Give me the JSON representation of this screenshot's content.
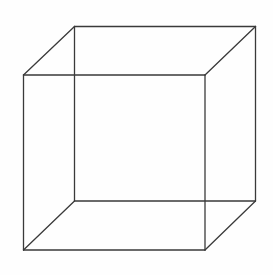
{
  "diagram": {
    "type": "wireframe-cube",
    "background": "#fefefe",
    "stroke_color": "#3a3a3a",
    "stroke_width": 1.3,
    "vertices": {
      "front_top_left": [
        23.5,
        75
      ],
      "front_top_right": [
        205,
        75
      ],
      "front_bottom_right": [
        205,
        250
      ],
      "front_bottom_left": [
        23.5,
        250
      ],
      "back_top_left": [
        74.5,
        26.5
      ],
      "back_top_right": [
        255.5,
        26.5
      ],
      "back_bottom_right": [
        255.5,
        201
      ],
      "back_bottom_left": [
        74.5,
        201
      ]
    },
    "edges": [
      {
        "name": "front-top-edge",
        "from": "front_top_left",
        "to": "front_top_right"
      },
      {
        "name": "front-right-edge",
        "from": "front_top_right",
        "to": "front_bottom_right"
      },
      {
        "name": "front-bottom-edge",
        "from": "front_bottom_right",
        "to": "front_bottom_left"
      },
      {
        "name": "front-left-edge",
        "from": "front_bottom_left",
        "to": "front_top_left"
      },
      {
        "name": "back-top-edge",
        "from": "back_top_left",
        "to": "back_top_right"
      },
      {
        "name": "back-right-edge",
        "from": "back_top_right",
        "to": "back_bottom_right"
      },
      {
        "name": "back-bottom-edge",
        "from": "back_bottom_right",
        "to": "back_bottom_left"
      },
      {
        "name": "back-left-edge",
        "from": "back_bottom_left",
        "to": "back_top_left"
      },
      {
        "name": "top-left-connector",
        "from": "front_top_left",
        "to": "back_top_left"
      },
      {
        "name": "top-right-connector",
        "from": "front_top_right",
        "to": "back_top_right"
      },
      {
        "name": "bottom-right-connector",
        "from": "front_bottom_right",
        "to": "back_bottom_right"
      },
      {
        "name": "bottom-left-connector",
        "from": "front_bottom_left",
        "to": "back_bottom_left"
      }
    ]
  }
}
